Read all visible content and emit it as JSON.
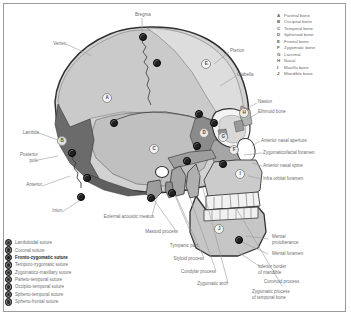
{
  "figure": {
    "frame_color": "#9a9a9a",
    "background": "#ffffff"
  },
  "bone_legend": {
    "items": [
      {
        "key": "A",
        "label": "Parietal bone"
      },
      {
        "key": "B",
        "label": "Occipital bone"
      },
      {
        "key": "C",
        "label": "Temporal bone"
      },
      {
        "key": "D",
        "label": "Sphenoid bone"
      },
      {
        "key": "E",
        "label": "Frontal bone"
      },
      {
        "key": "F",
        "label": "Zygomatic bone"
      },
      {
        "key": "G",
        "label": "Lacrimal"
      },
      {
        "key": "H",
        "label": "Nasal"
      },
      {
        "key": "I",
        "label": "Maxilla bone"
      },
      {
        "key": "J",
        "label": "Mandible bone"
      }
    ]
  },
  "suture_legend": {
    "items": [
      {
        "label": "Lambdoidal suture",
        "color": "#2b2b2b",
        "highlighted": false
      },
      {
        "label": "Coronal suture",
        "color": "#2b2b2b",
        "highlighted": false
      },
      {
        "label": "Fronto-zygomatic suture",
        "color": "#111111",
        "highlighted": true
      },
      {
        "label": "Temporo-zygomatic suture",
        "color": "#2b2b2b",
        "highlighted": false
      },
      {
        "label": "Zygomatico-maxillary suture",
        "color": "#2b2b2b",
        "highlighted": false
      },
      {
        "label": "Parieto-temporal suture",
        "color": "#2b2b2b",
        "highlighted": false
      },
      {
        "label": "Occipito-temporal suture",
        "color": "#2b2b2b",
        "highlighted": false
      },
      {
        "label": "Spheno-temporal suture",
        "color": "#2b2b2b",
        "highlighted": false
      },
      {
        "label": "Spheno-frontal suture",
        "color": "#2b2b2b",
        "highlighted": false
      }
    ]
  },
  "callouts": {
    "bregma": "Bregma",
    "vertex": "Vertex",
    "pterion": "Pterion",
    "glabella": "Glabella",
    "nasion": "Nasion",
    "ethmoid_bone": "Ethmoid bone",
    "lambda": "Lambda",
    "posterior_pole": "Posterior\npole",
    "anterior": "Anterior",
    "inion": "Inion",
    "anterior_nasal_aperture": "Anterior nasal aperture",
    "zygomaticofacial_foramen": "Zygomaticofacial foramen",
    "anterior_nasal_spine": "Anterior nasal spine",
    "infra_orbital_foramen": "Infra orbital foramen",
    "external_acoustic_meatus": "External acoustic meatus",
    "mastoid_process": "Mastoid process",
    "tympanic_part": "Tympanic part",
    "styloid_process": "Styloid process",
    "condylar_process": "Condylar process",
    "zygomatic_arch": "Zygomatic arch",
    "coronoid_process": "Coronoid process",
    "zygomatic_process_temporal": "Zygomatic process\nof temporal bone",
    "mental_protuberance": "Mental\nprotuberance",
    "mental_foramen": "Mental foramen",
    "inferior_border_mandible": "Inferior border\nof mandible"
  },
  "skull_markers": [
    {
      "key": "A",
      "x": 106,
      "y": 97
    },
    {
      "key": "B",
      "x": 61,
      "y": 140
    },
    {
      "key": "C",
      "x": 153,
      "y": 148
    },
    {
      "key": "D",
      "x": 203,
      "y": 132
    },
    {
      "key": "E",
      "x": 205,
      "y": 63
    },
    {
      "key": "F",
      "x": 233,
      "y": 149
    },
    {
      "key": "G",
      "x": 222,
      "y": 136
    },
    {
      "key": "H",
      "x": 243,
      "y": 112
    },
    {
      "key": "I",
      "x": 239,
      "y": 173
    },
    {
      "key": "J",
      "x": 218,
      "y": 228
    }
  ],
  "suture_dots": [
    {
      "name": "bregma-dot",
      "x": 142,
      "y": 36
    },
    {
      "name": "coronal-upper-dot",
      "x": 156,
      "y": 62
    },
    {
      "name": "parieto-temporal-dot",
      "x": 113,
      "y": 122
    },
    {
      "name": "lambdoidal-dot",
      "x": 71,
      "y": 152
    },
    {
      "name": "occipito-temporal-dot",
      "x": 86,
      "y": 177
    },
    {
      "name": "inion-dot",
      "x": 80,
      "y": 196
    },
    {
      "name": "spheno-frontal-dot",
      "x": 198,
      "y": 113
    },
    {
      "name": "spheno-temporal-dot",
      "x": 196,
      "y": 145
    },
    {
      "name": "fronto-zygomatic-dot",
      "x": 213,
      "y": 122
    },
    {
      "name": "temporo-zygomatic-dot",
      "x": 186,
      "y": 160
    },
    {
      "name": "zygomatico-maxillary-dot",
      "x": 222,
      "y": 163
    },
    {
      "name": "mental-foramen-dot",
      "x": 238,
      "y": 239
    },
    {
      "name": "mastoid-dot",
      "x": 150,
      "y": 197
    },
    {
      "name": "styloid-dot",
      "x": 171,
      "y": 192
    }
  ],
  "palette": {
    "cranium_light": "#d6d6d6",
    "parietal": "#c9c9c9",
    "temporal": "#bdbdbd",
    "occipital": "#6e6e6e",
    "sphenoid": "#8a8a8a",
    "frontal": "#dcdcdc",
    "face_mid": "#a8a8a8",
    "maxilla": "#cfcfcf",
    "mandible": "#c4c4c4",
    "teeth": "#f2f2f2",
    "outline": "#2f2f2f",
    "leader": "#9b9b9b"
  }
}
